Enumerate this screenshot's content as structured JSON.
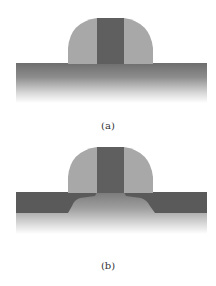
{
  "figure": {
    "panels": [
      {
        "id": "a",
        "caption": "(a)",
        "description": "Gate with sidewall spacer on substrate"
      },
      {
        "id": "b",
        "caption": "(b)",
        "description": "Gate with sidewall spacer and source/drain doped regions"
      }
    ],
    "colors": {
      "spacer": "#a8a8a8",
      "gate": "#5f5f5f",
      "substrate_top": "#6e6e6e",
      "doped_region": "#5a5a5a",
      "background": "#ffffff"
    }
  }
}
